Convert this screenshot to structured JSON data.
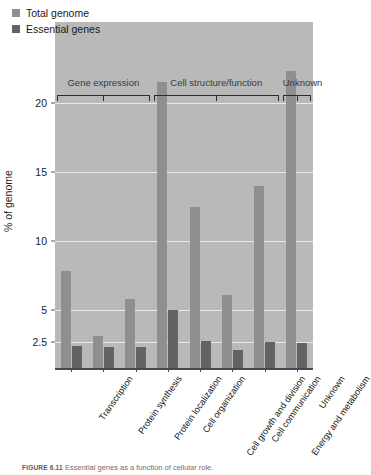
{
  "figure": {
    "caption_number": "FIGURE 6.11",
    "caption_text": "Essential genes as a function of cellular role."
  },
  "legend": {
    "position": "top-left",
    "items": [
      {
        "label": "Total genome",
        "color": "#8f8f8f",
        "swatch_icon": "square-swatch"
      },
      {
        "label": "Essential genes",
        "color": "#636363",
        "swatch_icon": "square-swatch"
      }
    ]
  },
  "axes": {
    "ylabel": "% of genome",
    "ytick_labels": [
      "2.5",
      "5",
      "10",
      "15",
      "20"
    ],
    "xlabel": ""
  },
  "groups": [
    {
      "label": "Gene expression",
      "start": 0,
      "end": 2
    },
    {
      "label": "Cell structure/function",
      "start": 3,
      "end": 6
    },
    {
      "label": "Unknown",
      "start": 7,
      "end": 7
    }
  ],
  "chart_data": {
    "type": "bar",
    "title": "",
    "subtitle": "",
    "xlabel": "",
    "ylabel": "% of genome",
    "ylim": [
      0,
      23
    ],
    "yticks": [
      2.5,
      5,
      10,
      15,
      20
    ],
    "grid": true,
    "legend_position": "top-left",
    "categories": [
      "Transcription",
      "Protein synthesis",
      "Protein localization",
      "Cell organization",
      "Cell growth and division",
      "Cell communication",
      "Energy and metabolism",
      "Unknown"
    ],
    "series": [
      {
        "name": "Total genome",
        "color": "#8f8f8f",
        "values": [
          7.8,
          3.0,
          5.8,
          21.5,
          12.5,
          6.1,
          14.0,
          22.3
        ]
      },
      {
        "name": "Essential genes",
        "color": "#636363",
        "values": [
          2.1,
          2.0,
          2.0,
          5.0,
          2.6,
          1.7,
          2.5,
          2.4
        ]
      }
    ],
    "annotations": [
      {
        "text": "Gene expression",
        "covers": [
          "Transcription",
          "Protein synthesis",
          "Protein localization"
        ]
      },
      {
        "text": "Cell structure/function",
        "covers": [
          "Cell organization",
          "Cell growth and division",
          "Cell communication",
          "Energy and metabolism"
        ]
      },
      {
        "text": "Unknown",
        "covers": [
          "Unknown"
        ]
      }
    ]
  }
}
